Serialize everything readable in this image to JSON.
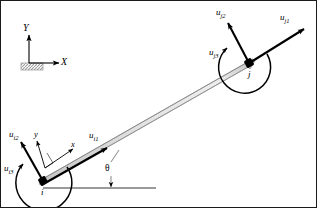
{
  "figure": {
    "colors": {
      "ink": "#000000",
      "beam_fill_light": "#f2f2f2",
      "beam_fill_mid": "#d9d9d9",
      "beam_edge": "#8c8c8c",
      "ground_line": "#9a9a9a",
      "hatch": "#a6a6a6",
      "border": "#1a1a1a"
    },
    "global_axes": {
      "x_label": "X",
      "y_label": "Y",
      "origin": {
        "x": 28,
        "y": 68
      },
      "support_name": "ground-hatch-block"
    },
    "local_axes": {
      "x_label": "x",
      "y_label": "y"
    },
    "angle": {
      "symbol": "θ",
      "description": "inclination of element from horizontal"
    },
    "nodes": [
      {
        "id": "i",
        "label": "i",
        "x": 42,
        "y": 180
      },
      {
        "id": "j",
        "label": "j",
        "x": 248,
        "y": 62
      }
    ],
    "element": {
      "name": "beam-element",
      "from": "i",
      "to": "j"
    },
    "dofs": [
      {
        "key": "ui1",
        "u": "u",
        "sub": "i1",
        "node": "i",
        "type": "translation-axial",
        "label_x": 88,
        "label_y": 130
      },
      {
        "key": "ui2",
        "u": "u",
        "sub": "i2",
        "node": "i",
        "type": "translation-transverse",
        "label_x": 8,
        "label_y": 129
      },
      {
        "key": "ui3",
        "u": "u",
        "sub": "i3",
        "node": "i",
        "type": "rotation",
        "label_x": 3,
        "label_y": 163
      },
      {
        "key": "uj1",
        "u": "u",
        "sub": "j1",
        "node": "j",
        "type": "translation-axial",
        "label_x": 279,
        "label_y": 12
      },
      {
        "key": "uj2",
        "u": "u",
        "sub": "j2",
        "node": "j",
        "type": "translation-transverse",
        "label_x": 215,
        "label_y": 7
      },
      {
        "key": "uj3",
        "u": "u",
        "sub": "j3",
        "node": "j",
        "type": "rotation",
        "label_x": 208,
        "label_y": 47
      }
    ],
    "reference_line": {
      "name": "horizontal-datum-line",
      "x1": 42,
      "y1": 187,
      "x2": 155,
      "y2": 187
    }
  }
}
